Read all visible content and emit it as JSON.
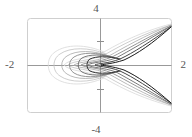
{
  "figure": {
    "background_color": "#ffffff",
    "frame_color": "#cfcfcf",
    "axis_color": "#999999"
  },
  "axis_labels": {
    "top": "4",
    "bottom": "-4",
    "left": "-2",
    "right": "2"
  },
  "chart_data": {
    "type": "line",
    "title": "",
    "xlabel": "",
    "ylabel": "",
    "xlim": [
      -2,
      2
    ],
    "ylim": [
      -4,
      4
    ],
    "grid": false,
    "legend": null,
    "x_ticks": [
      -2,
      2
    ],
    "x_tick_labels": [
      "-2",
      "2"
    ],
    "y_ticks": [
      -4,
      -2,
      2,
      4
    ],
    "y_tick_labels": [
      "-4",
      "-2",
      "2",
      "4"
    ],
    "axes_through_origin": true,
    "series": [
      {
        "name": "contour-1",
        "color": "#d8d8d8",
        "width": 0.8,
        "path": "M 171,24 C 140,32 118,44 104,52 C 86,60 70,58 64,65 C 70,72 86,70 104,78 C 118,86 140,98 171,106"
      },
      {
        "name": "contour-2",
        "color": "#c2c2c2",
        "width": 0.8,
        "path": "M 171,25 C 142,34 120,46 106,54 C 88,62 74,60 68,65 C 74,70 88,68 106,76 C 120,84 142,96 171,105"
      },
      {
        "name": "contour-3",
        "color": "#a8a8a8",
        "width": 0.8,
        "path": "M 171,25 C 144,36 123,48 109,56 C 92,63 80,61 74,65 C 80,69 92,67 109,74 C 123,82 144,94 171,105"
      },
      {
        "name": "contour-4",
        "color": "#8a8a8a",
        "width": 0.9,
        "path": "M 171,26 C 146,38 126,50 112,57 C 97,63 86,62 81,65 C 86,68 97,67 112,73 C 126,80 146,92 171,104"
      },
      {
        "name": "contour-5",
        "color": "#6a6a6a",
        "width": 0.9,
        "path": "M 171,26 C 148,40 129,51 116,58 C 102,63 92,62 88,65 C 92,68 102,67 116,72 C 129,79 148,90 171,104"
      },
      {
        "name": "contour-6",
        "color": "#444444",
        "width": 1.0,
        "path": "M 171,27 C 150,42 133,53 120,59 C 107,64 98,63 95,65 C 98,67 107,66 120,71 C 133,77 150,88 171,103"
      },
      {
        "name": "contour-7",
        "color": "#1a1a1a",
        "width": 1.0,
        "path": "M 171,27 C 152,44 137,54 124,60 C 112,64 104,64 101,65 C 104,66 112,66 124,70 C 137,76 152,86 171,103"
      },
      {
        "name": "closed-loop-1",
        "color": "#d8d8d8",
        "width": 0.8,
        "path": "M 104,52 C 86,44 66,44 55,52 C 46,58 46,72 55,78 C 66,86 86,86 104,78"
      },
      {
        "name": "closed-loop-2",
        "color": "#c2c2c2",
        "width": 0.8,
        "path": "M 106,54 C 89,47 70,47 60,54 C 52,59 52,71 60,76 C 70,83 89,83 106,76"
      },
      {
        "name": "closed-loop-3",
        "color": "#a8a8a8",
        "width": 0.8,
        "path": "M 109,56 C 93,50 76,50 67,56 C 60,60 60,70 67,74 C 76,80 93,80 109,74"
      },
      {
        "name": "closed-loop-4",
        "color": "#8a8a8a",
        "width": 0.9,
        "path": "M 112,57 C 97,52 82,52 74,57 C 68,61 68,69 74,73 C 82,78 97,78 112,73"
      },
      {
        "name": "closed-loop-5",
        "color": "#6a6a6a",
        "width": 0.9,
        "path": "M 116,58 C 102,54 89,54 82,58 C 77,61 77,69 82,72 C 89,76 102,76 116,72"
      },
      {
        "name": "closed-loop-6",
        "color": "#333333",
        "width": 1.0,
        "path": "M 120,59 C 108,56 96,56 90,59 C 86,61 86,69 90,71 C 96,74 108,74 120,71"
      }
    ]
  }
}
